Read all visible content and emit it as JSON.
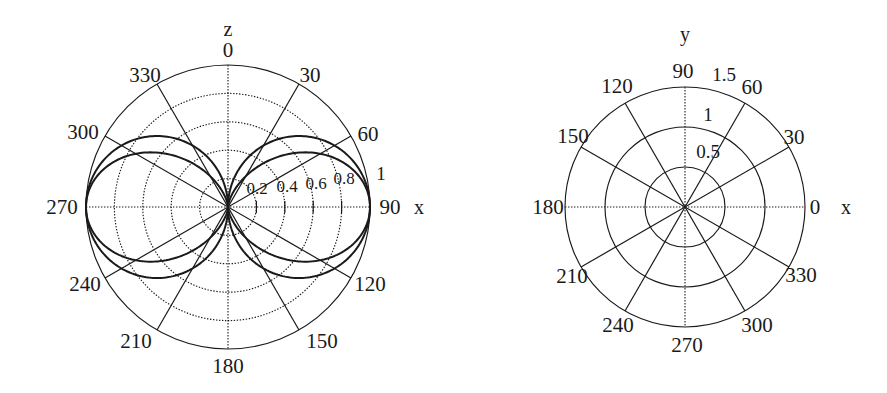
{
  "figure": {
    "background": "#ffffff",
    "ink_color": "#1a1a1a",
    "width": 887,
    "height": 393
  },
  "chart_data": [
    {
      "id": "left-polar",
      "type": "line",
      "subtype": "polar",
      "title": "",
      "vertical_axis_label": "z",
      "horizontal_axis_label": "x",
      "angle_unit": "degrees",
      "angle_zero_at": "top",
      "angle_direction": "clockwise",
      "angular_ticks": [
        0,
        30,
        60,
        90,
        120,
        150,
        180,
        210,
        240,
        270,
        300,
        330
      ],
      "angular_tick_labels": [
        "0",
        "30",
        "60",
        "90",
        "120",
        "150",
        "180",
        "210",
        "240",
        "270",
        "300",
        "330"
      ],
      "radial_ticks": [
        0.2,
        0.4,
        0.6,
        0.8,
        1
      ],
      "radial_tick_labels": [
        "0.2",
        "0.4",
        "0.6",
        "0.8",
        "1"
      ],
      "rlim": [
        0,
        1
      ],
      "grid": true,
      "legend": false,
      "center_px": [
        228,
        207
      ],
      "radius_px": 142,
      "series": [
        {
          "name": "dipole pattern sin(theta)",
          "formula": "r = |sin(theta)|",
          "theta_deg": [
            0,
            10,
            20,
            30,
            40,
            50,
            60,
            70,
            80,
            90,
            100,
            110,
            120,
            130,
            140,
            150,
            160,
            170,
            180,
            190,
            200,
            210,
            220,
            230,
            240,
            250,
            260,
            270,
            280,
            290,
            300,
            310,
            320,
            330,
            340,
            350,
            360
          ],
          "r": [
            0,
            0.174,
            0.342,
            0.5,
            0.643,
            0.766,
            0.866,
            0.94,
            0.985,
            1,
            0.985,
            0.94,
            0.866,
            0.766,
            0.643,
            0.5,
            0.342,
            0.174,
            0,
            0.174,
            0.342,
            0.5,
            0.643,
            0.766,
            0.866,
            0.94,
            0.985,
            1,
            0.985,
            0.94,
            0.866,
            0.766,
            0.643,
            0.5,
            0.342,
            0.174,
            0
          ]
        },
        {
          "name": "dipole pattern sin^2(theta)",
          "formula": "r = sin^2(theta)",
          "theta_deg": [
            0,
            10,
            20,
            30,
            40,
            50,
            60,
            70,
            80,
            90,
            100,
            110,
            120,
            130,
            140,
            150,
            160,
            170,
            180,
            190,
            200,
            210,
            220,
            230,
            240,
            250,
            260,
            270,
            280,
            290,
            300,
            310,
            320,
            330,
            340,
            350,
            360
          ],
          "r": [
            0,
            0.03,
            0.117,
            0.25,
            0.413,
            0.587,
            0.75,
            0.883,
            0.97,
            1,
            0.97,
            0.883,
            0.75,
            0.587,
            0.413,
            0.25,
            0.117,
            0.03,
            0,
            0.03,
            0.117,
            0.25,
            0.413,
            0.587,
            0.75,
            0.883,
            0.97,
            1,
            0.97,
            0.883,
            0.75,
            0.587,
            0.413,
            0.25,
            0.117,
            0.03,
            0
          ]
        }
      ]
    },
    {
      "id": "right-polar",
      "type": "line",
      "subtype": "polar",
      "title": "",
      "vertical_axis_label": "y",
      "horizontal_axis_label": "x",
      "angle_unit": "degrees",
      "angle_zero_at": "right",
      "angle_direction": "counterclockwise",
      "angular_ticks": [
        0,
        30,
        60,
        90,
        120,
        150,
        180,
        210,
        240,
        270,
        300,
        330
      ],
      "angular_tick_labels": [
        "0",
        "30",
        "60",
        "90",
        "120",
        "150",
        "180",
        "210",
        "240",
        "270",
        "300",
        "330"
      ],
      "radial_ticks": [
        0.5,
        1,
        1.5
      ],
      "radial_tick_labels": [
        "0.5",
        "1",
        "1.5"
      ],
      "rlim": [
        0,
        1.5
      ],
      "grid": true,
      "legend": false,
      "center_px": [
        685,
        207
      ],
      "radius_px": 120,
      "series": []
    }
  ]
}
